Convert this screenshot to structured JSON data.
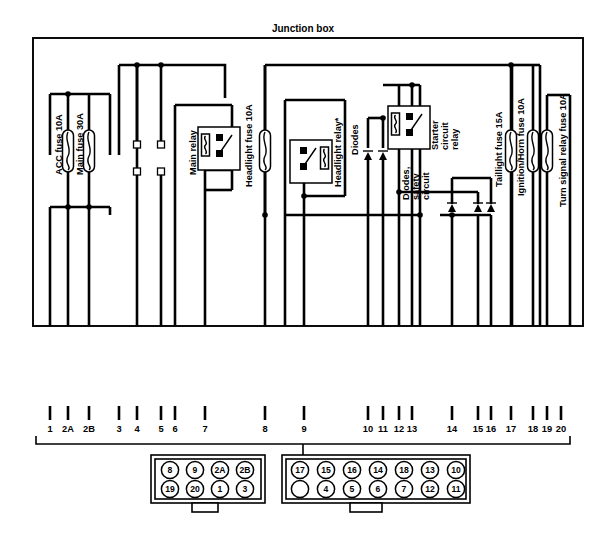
{
  "diagram": {
    "title": "Junction box",
    "components": [
      {
        "id": "acc-fuse",
        "label": "ACC fuse 10A",
        "type": "fuse",
        "x": 68,
        "y_label": 175
      },
      {
        "id": "main-fuse",
        "label": "Main fuse 30A",
        "type": "fuse",
        "x": 89,
        "y_label": 175
      },
      {
        "id": "main-relay",
        "label": "Main relay",
        "type": "relay",
        "x": 186,
        "y_label": 165
      },
      {
        "id": "headlight-fuse",
        "label": "Headlight fuse 10A",
        "type": "fuse",
        "x": 256,
        "y_label": 175
      },
      {
        "id": "headlight-relay",
        "label": "Headlight relay*",
        "type": "relay",
        "x": 325,
        "y_label": 170
      },
      {
        "id": "diodes",
        "label": "Diodes",
        "type": "diode",
        "x": 350,
        "y_label": 160
      },
      {
        "id": "starter-circuit-relay",
        "label": "Starter circuit relay",
        "type": "relay",
        "x": 424,
        "y_label": 148
      },
      {
        "id": "diodes-safety",
        "label": "Diodes, safety circuit",
        "type": "diode",
        "x": 414,
        "y_label": 198
      },
      {
        "id": "taillight-fuse",
        "label": "Taillight fuse 15A",
        "type": "fuse",
        "x": 497,
        "y_label": 175
      },
      {
        "id": "ignition-horn-fuse",
        "label": "Ignition/Horn fuse 10A",
        "type": "fuse",
        "x": 521,
        "y_label": 175
      },
      {
        "id": "turn-signal-fuse",
        "label": "Turn signal relay fuse 10A",
        "type": "fuse",
        "x": 556,
        "y_label": 175
      }
    ],
    "terminal_numbers": [
      {
        "label": "1",
        "x": 50
      },
      {
        "label": "2A",
        "x": 68
      },
      {
        "label": "2B",
        "x": 89
      },
      {
        "label": "3",
        "x": 119
      },
      {
        "label": "4",
        "x": 137
      },
      {
        "label": "5",
        "x": 161
      },
      {
        "label": "6",
        "x": 175
      },
      {
        "label": "7",
        "x": 205
      },
      {
        "label": "8",
        "x": 265
      },
      {
        "label": "9",
        "x": 304
      },
      {
        "label": "10",
        "x": 368
      },
      {
        "label": "11",
        "x": 383
      },
      {
        "label": "12",
        "x": 399
      },
      {
        "label": "13",
        "x": 412
      },
      {
        "label": "14",
        "x": 452
      },
      {
        "label": "15",
        "x": 478
      },
      {
        "label": "16",
        "x": 491
      },
      {
        "label": "17",
        "x": 511
      },
      {
        "label": "18",
        "x": 533
      },
      {
        "label": "19",
        "x": 547
      },
      {
        "label": "20",
        "x": 561
      }
    ],
    "connector_left": {
      "name": "8-pin connector",
      "rows": [
        [
          "8",
          "9",
          "2A",
          "2B"
        ],
        [
          "19",
          "20",
          "1",
          "3"
        ]
      ]
    },
    "connector_right": {
      "name": "14-pin connector",
      "rows": [
        [
          "17",
          "15",
          "16",
          "14",
          "18",
          "13",
          "10"
        ],
        [
          "",
          "4",
          "5",
          "6",
          "7",
          "12",
          "11"
        ]
      ]
    },
    "colors": {
      "line": "#000000",
      "background": "#ffffff",
      "fill": "#ffffff"
    }
  }
}
